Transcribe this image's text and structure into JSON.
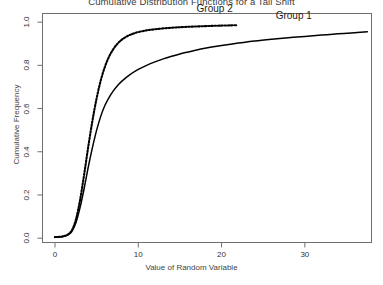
{
  "chart_data": {
    "type": "line",
    "title": "Cumulative Distribution Functions for a Tail Shift",
    "xlabel": "Value of Random Variable",
    "ylabel": "Cumulative Frequency",
    "xlim": [
      -1.5,
      38
    ],
    "ylim": [
      -0.02,
      1.04
    ],
    "xticks": [
      0,
      10,
      20,
      30
    ],
    "xticklabels": [
      "0",
      "10",
      "20",
      "30"
    ],
    "yticks": [
      0.0,
      0.2,
      0.4,
      0.6,
      0.8,
      1.0
    ],
    "yticklabels": [
      "0.0",
      "0.2",
      "0.4",
      "0.6",
      "0.8",
      "1.0"
    ],
    "grid": false,
    "legend_position": "inline-annotations",
    "series": [
      {
        "name": "Group 1",
        "style": "solid",
        "color": "#000000",
        "label_x": 26.5,
        "label_y": 0.975,
        "x": [
          0.0,
          0.5,
          1.0,
          1.5,
          2.0,
          2.5,
          3.0,
          3.5,
          4.0,
          4.5,
          5.0,
          5.5,
          6.0,
          6.5,
          7.0,
          7.5,
          8.0,
          9.0,
          10.0,
          11.0,
          12.0,
          13.0,
          14.0,
          15.0,
          16.0,
          17.0,
          18.0,
          19.0,
          20.0,
          22.0,
          24.0,
          26.0,
          28.0,
          30.0,
          32.0,
          34.0,
          36.0,
          37.5
        ],
        "y": [
          0.005,
          0.006,
          0.008,
          0.014,
          0.03,
          0.07,
          0.14,
          0.23,
          0.33,
          0.42,
          0.5,
          0.565,
          0.615,
          0.652,
          0.682,
          0.706,
          0.726,
          0.757,
          0.781,
          0.8,
          0.816,
          0.83,
          0.842,
          0.853,
          0.862,
          0.871,
          0.879,
          0.886,
          0.892,
          0.903,
          0.913,
          0.921,
          0.928,
          0.934,
          0.94,
          0.946,
          0.951,
          0.955
        ]
      },
      {
        "name": "Group 2",
        "style": "dotted",
        "color": "#000000",
        "label_x": 17.0,
        "label_y": 1.005,
        "x": [
          0.0,
          0.5,
          1.0,
          1.5,
          2.0,
          2.5,
          3.0,
          3.5,
          4.0,
          4.5,
          5.0,
          5.5,
          6.0,
          6.5,
          7.0,
          7.5,
          8.0,
          8.5,
          9.0,
          9.5,
          10.0,
          11.0,
          12.0,
          13.0,
          14.0,
          15.0,
          16.0,
          17.0,
          18.0,
          19.0,
          20.0,
          21.0,
          21.8
        ],
        "y": [
          0.005,
          0.006,
          0.009,
          0.016,
          0.035,
          0.085,
          0.175,
          0.295,
          0.425,
          0.545,
          0.648,
          0.731,
          0.794,
          0.841,
          0.875,
          0.9,
          0.918,
          0.931,
          0.941,
          0.948,
          0.954,
          0.962,
          0.967,
          0.971,
          0.974,
          0.9765,
          0.9785,
          0.98,
          0.9815,
          0.9828,
          0.984,
          0.985,
          0.9856
        ]
      }
    ]
  }
}
